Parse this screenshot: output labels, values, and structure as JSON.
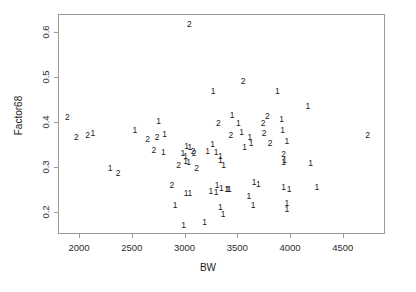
{
  "chart_data": {
    "type": "scatter",
    "title": "",
    "xlabel": "BW",
    "ylabel": "Factor68",
    "xlim": [
      1800,
      4900
    ],
    "ylim": [
      0.15,
      0.64
    ],
    "grid": false,
    "legend": null,
    "marker_encoding": "plotting character is the group code, \"1\" or \"2\"",
    "xticks": [
      2000,
      2500,
      3000,
      3500,
      4000,
      4500
    ],
    "xticklabels": [
      "2000",
      "2500",
      "3000",
      "3500",
      "4000",
      "4500"
    ],
    "yticks": [
      0.2,
      0.3,
      0.4,
      0.5,
      0.6
    ],
    "yticklabels": [
      "0.2",
      "0.3",
      "0.4",
      "0.5",
      "0.6"
    ],
    "series": [
      {
        "name": "1",
        "label": "1",
        "points": [
          {
            "x": 2745,
            "y": 0.405
          },
          {
            "x": 2520,
            "y": 0.385
          },
          {
            "x": 2800,
            "y": 0.375
          },
          {
            "x": 2790,
            "y": 0.335
          },
          {
            "x": 3010,
            "y": 0.348
          },
          {
            "x": 3040,
            "y": 0.345
          },
          {
            "x": 2975,
            "y": 0.333
          },
          {
            "x": 3000,
            "y": 0.327
          },
          {
            "x": 3000,
            "y": 0.316
          },
          {
            "x": 3030,
            "y": 0.313
          },
          {
            "x": 3005,
            "y": 0.243
          },
          {
            "x": 3040,
            "y": 0.243
          },
          {
            "x": 2900,
            "y": 0.218
          },
          {
            "x": 2980,
            "y": 0.172
          },
          {
            "x": 3260,
            "y": 0.47
          },
          {
            "x": 3255,
            "y": 0.353
          },
          {
            "x": 3210,
            "y": 0.338
          },
          {
            "x": 3290,
            "y": 0.335
          },
          {
            "x": 3330,
            "y": 0.327
          },
          {
            "x": 3330,
            "y": 0.318
          },
          {
            "x": 3360,
            "y": 0.305
          },
          {
            "x": 3300,
            "y": 0.262
          },
          {
            "x": 3340,
            "y": 0.255
          },
          {
            "x": 3390,
            "y": 0.253
          },
          {
            "x": 3400,
            "y": 0.253
          },
          {
            "x": 3415,
            "y": 0.252
          },
          {
            "x": 3240,
            "y": 0.249
          },
          {
            "x": 3290,
            "y": 0.245
          },
          {
            "x": 3330,
            "y": 0.213
          },
          {
            "x": 3355,
            "y": 0.196
          },
          {
            "x": 3180,
            "y": 0.178
          },
          {
            "x": 3440,
            "y": 0.418
          },
          {
            "x": 3500,
            "y": 0.4
          },
          {
            "x": 3530,
            "y": 0.38
          },
          {
            "x": 3560,
            "y": 0.345
          },
          {
            "x": 3610,
            "y": 0.368
          },
          {
            "x": 3620,
            "y": 0.355
          },
          {
            "x": 3650,
            "y": 0.268
          },
          {
            "x": 3690,
            "y": 0.264
          },
          {
            "x": 3600,
            "y": 0.236
          },
          {
            "x": 3640,
            "y": 0.216
          },
          {
            "x": 3870,
            "y": 0.47
          },
          {
            "x": 3910,
            "y": 0.408
          },
          {
            "x": 3920,
            "y": 0.385
          },
          {
            "x": 3960,
            "y": 0.36
          },
          {
            "x": 3940,
            "y": 0.318
          },
          {
            "x": 3930,
            "y": 0.312
          },
          {
            "x": 3930,
            "y": 0.258
          },
          {
            "x": 3980,
            "y": 0.252
          },
          {
            "x": 3960,
            "y": 0.222
          },
          {
            "x": 3960,
            "y": 0.208
          },
          {
            "x": 4160,
            "y": 0.437
          },
          {
            "x": 4185,
            "y": 0.31
          },
          {
            "x": 4245,
            "y": 0.258
          },
          {
            "x": 2120,
            "y": 0.378
          },
          {
            "x": 2285,
            "y": 0.3
          }
        ]
      },
      {
        "name": "2",
        "label": "2",
        "points": [
          {
            "x": 3035,
            "y": 0.62
          },
          {
            "x": 3545,
            "y": 0.492
          },
          {
            "x": 1880,
            "y": 0.412
          },
          {
            "x": 1965,
            "y": 0.368
          },
          {
            "x": 2070,
            "y": 0.372
          },
          {
            "x": 2360,
            "y": 0.288
          },
          {
            "x": 2640,
            "y": 0.363
          },
          {
            "x": 2730,
            "y": 0.368
          },
          {
            "x": 2700,
            "y": 0.34
          },
          {
            "x": 2870,
            "y": 0.262
          },
          {
            "x": 2935,
            "y": 0.305
          },
          {
            "x": 3070,
            "y": 0.338
          },
          {
            "x": 3080,
            "y": 0.332
          },
          {
            "x": 3105,
            "y": 0.3
          },
          {
            "x": 3310,
            "y": 0.4
          },
          {
            "x": 3430,
            "y": 0.372
          },
          {
            "x": 3735,
            "y": 0.4
          },
          {
            "x": 3775,
            "y": 0.415
          },
          {
            "x": 3745,
            "y": 0.378
          },
          {
            "x": 3800,
            "y": 0.355
          },
          {
            "x": 3930,
            "y": 0.33
          },
          {
            "x": 4725,
            "y": 0.372
          }
        ]
      }
    ]
  },
  "axes": {
    "x_title": "BW",
    "y_title": "Factor68",
    "x_tick_labels": [
      "2000",
      "2500",
      "3000",
      "3500",
      "4000",
      "4500"
    ],
    "y_tick_labels": [
      "0.2",
      "0.3",
      "0.4",
      "0.5",
      "0.6"
    ]
  },
  "colors": {
    "background": "#ffffff",
    "axis": "#9a9a9a",
    "point": "#1a1a1a",
    "tick_label": "#2b2b2b"
  }
}
